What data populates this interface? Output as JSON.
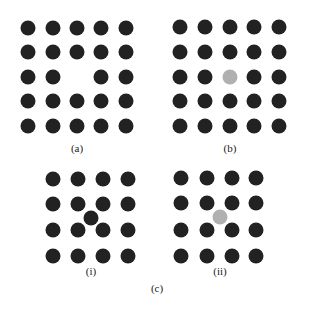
{
  "colors": {
    "dark": "#222222",
    "grey": "#b0b0b0"
  },
  "panels": {
    "a": {
      "label": "(a)",
      "label_pos": [
        77,
        148
      ]
    },
    "b": {
      "label": "(b)",
      "label_pos": [
        230,
        148
      ]
    },
    "c_i": {
      "label": "(i)",
      "label_pos": [
        91,
        271
      ]
    },
    "c_ii": {
      "label": "(ii)",
      "label_pos": [
        220,
        271
      ]
    },
    "c": {
      "label": "(c)",
      "label_pos": [
        157,
        288
      ]
    }
  },
  "dots": [
    {
      "x": 28,
      "y": 28,
      "c": "dark"
    },
    {
      "x": 53,
      "y": 28,
      "c": "dark"
    },
    {
      "x": 77,
      "y": 28,
      "c": "dark"
    },
    {
      "x": 101,
      "y": 28,
      "c": "dark"
    },
    {
      "x": 126,
      "y": 28,
      "c": "dark"
    },
    {
      "x": 28,
      "y": 52,
      "c": "dark"
    },
    {
      "x": 53,
      "y": 52,
      "c": "dark"
    },
    {
      "x": 77,
      "y": 52,
      "c": "dark"
    },
    {
      "x": 101,
      "y": 52,
      "c": "dark"
    },
    {
      "x": 126,
      "y": 52,
      "c": "dark"
    },
    {
      "x": 28,
      "y": 77,
      "c": "dark"
    },
    {
      "x": 53,
      "y": 77,
      "c": "dark"
    },
    {
      "x": 101,
      "y": 77,
      "c": "dark"
    },
    {
      "x": 126,
      "y": 77,
      "c": "dark"
    },
    {
      "x": 28,
      "y": 101,
      "c": "dark"
    },
    {
      "x": 53,
      "y": 101,
      "c": "dark"
    },
    {
      "x": 77,
      "y": 101,
      "c": "dark"
    },
    {
      "x": 101,
      "y": 101,
      "c": "dark"
    },
    {
      "x": 126,
      "y": 101,
      "c": "dark"
    },
    {
      "x": 28,
      "y": 126,
      "c": "dark"
    },
    {
      "x": 53,
      "y": 126,
      "c": "dark"
    },
    {
      "x": 77,
      "y": 126,
      "c": "dark"
    },
    {
      "x": 101,
      "y": 126,
      "c": "dark"
    },
    {
      "x": 126,
      "y": 126,
      "c": "dark"
    },
    {
      "x": 180,
      "y": 27,
      "c": "dark"
    },
    {
      "x": 205,
      "y": 27,
      "c": "dark"
    },
    {
      "x": 230,
      "y": 27,
      "c": "dark"
    },
    {
      "x": 254,
      "y": 27,
      "c": "dark"
    },
    {
      "x": 279,
      "y": 27,
      "c": "dark"
    },
    {
      "x": 180,
      "y": 52,
      "c": "dark"
    },
    {
      "x": 205,
      "y": 52,
      "c": "dark"
    },
    {
      "x": 230,
      "y": 52,
      "c": "dark"
    },
    {
      "x": 254,
      "y": 52,
      "c": "dark"
    },
    {
      "x": 279,
      "y": 52,
      "c": "dark"
    },
    {
      "x": 180,
      "y": 77,
      "c": "dark"
    },
    {
      "x": 205,
      "y": 77,
      "c": "dark"
    },
    {
      "x": 230,
      "y": 77,
      "c": "grey"
    },
    {
      "x": 254,
      "y": 77,
      "c": "dark"
    },
    {
      "x": 279,
      "y": 77,
      "c": "dark"
    },
    {
      "x": 180,
      "y": 101,
      "c": "dark"
    },
    {
      "x": 205,
      "y": 101,
      "c": "dark"
    },
    {
      "x": 230,
      "y": 101,
      "c": "dark"
    },
    {
      "x": 254,
      "y": 101,
      "c": "dark"
    },
    {
      "x": 279,
      "y": 101,
      "c": "dark"
    },
    {
      "x": 180,
      "y": 126,
      "c": "dark"
    },
    {
      "x": 205,
      "y": 126,
      "c": "dark"
    },
    {
      "x": 230,
      "y": 126,
      "c": "dark"
    },
    {
      "x": 254,
      "y": 126,
      "c": "dark"
    },
    {
      "x": 279,
      "y": 126,
      "c": "dark"
    },
    {
      "x": 53,
      "y": 179,
      "c": "dark"
    },
    {
      "x": 78,
      "y": 179,
      "c": "dark"
    },
    {
      "x": 103,
      "y": 179,
      "c": "dark"
    },
    {
      "x": 128,
      "y": 179,
      "c": "dark"
    },
    {
      "x": 53,
      "y": 204,
      "c": "dark"
    },
    {
      "x": 78,
      "y": 204,
      "c": "dark"
    },
    {
      "x": 103,
      "y": 204,
      "c": "dark"
    },
    {
      "x": 128,
      "y": 204,
      "c": "dark"
    },
    {
      "x": 91,
      "y": 218,
      "c": "dark"
    },
    {
      "x": 53,
      "y": 230,
      "c": "dark"
    },
    {
      "x": 78,
      "y": 230,
      "c": "dark"
    },
    {
      "x": 103,
      "y": 230,
      "c": "dark"
    },
    {
      "x": 128,
      "y": 230,
      "c": "dark"
    },
    {
      "x": 53,
      "y": 256,
      "c": "dark"
    },
    {
      "x": 78,
      "y": 256,
      "c": "dark"
    },
    {
      "x": 103,
      "y": 256,
      "c": "dark"
    },
    {
      "x": 128,
      "y": 256,
      "c": "dark"
    },
    {
      "x": 181,
      "y": 178,
      "c": "dark"
    },
    {
      "x": 207,
      "y": 178,
      "c": "dark"
    },
    {
      "x": 232,
      "y": 178,
      "c": "dark"
    },
    {
      "x": 256,
      "y": 178,
      "c": "dark"
    },
    {
      "x": 181,
      "y": 203,
      "c": "dark"
    },
    {
      "x": 207,
      "y": 203,
      "c": "dark"
    },
    {
      "x": 232,
      "y": 203,
      "c": "dark"
    },
    {
      "x": 256,
      "y": 203,
      "c": "dark"
    },
    {
      "x": 220,
      "y": 217,
      "c": "grey"
    },
    {
      "x": 181,
      "y": 230,
      "c": "dark"
    },
    {
      "x": 207,
      "y": 230,
      "c": "dark"
    },
    {
      "x": 232,
      "y": 230,
      "c": "dark"
    },
    {
      "x": 256,
      "y": 230,
      "c": "dark"
    },
    {
      "x": 181,
      "y": 256,
      "c": "dark"
    },
    {
      "x": 207,
      "y": 256,
      "c": "dark"
    },
    {
      "x": 232,
      "y": 256,
      "c": "dark"
    },
    {
      "x": 256,
      "y": 256,
      "c": "dark"
    }
  ]
}
